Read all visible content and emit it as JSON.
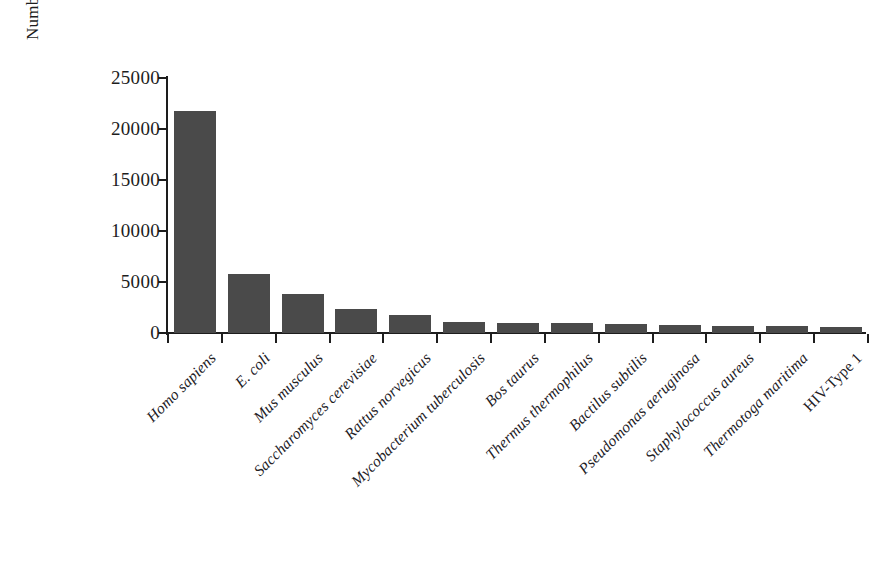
{
  "chart_data": {
    "type": "bar",
    "title": "",
    "xlabel": "",
    "ylabel": "Number of structures deposited",
    "ylim": [
      0,
      25000
    ],
    "ytick_labels": [
      "0",
      "5000",
      "10000",
      "15000",
      "20000",
      "25000"
    ],
    "ytick_values": [
      0,
      5000,
      10000,
      15000,
      20000,
      25000
    ],
    "grid": false,
    "legend": false,
    "bar_color": "#4a4a4a",
    "axis_color": "#1d1d1d",
    "background_color": "#ffffff",
    "categories": [
      "Homo sapiens",
      "E. coli",
      "Mus musculus",
      "Saccharomyces cerevisiae",
      "Rattus norvegicus",
      "Mycobacterium tuberculosis",
      "Bos taurus",
      "Thermus thermophilus",
      "Bactilus subtilis",
      "Pseudomonas aeruginosa",
      "Staphylococcus aureus",
      "Thermotoga maritima",
      "HIV-Type 1"
    ],
    "category_styles": [
      "italic",
      "italic",
      "italic",
      "italic",
      "italic",
      "italic",
      "italic",
      "italic",
      "italic",
      "italic",
      "italic",
      "italic",
      "upright"
    ],
    "values": [
      21800,
      5800,
      3800,
      2400,
      1800,
      1050,
      1000,
      980,
      900,
      800,
      680,
      650,
      600
    ]
  }
}
